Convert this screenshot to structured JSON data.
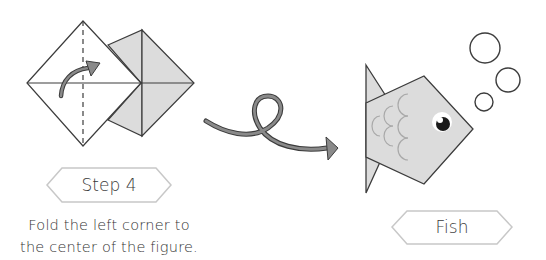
{
  "step": {
    "badge_label": "Step 4",
    "instruction_line1": "Fold the left corner to",
    "instruction_line2": "the center of the figure."
  },
  "result": {
    "badge_label": "Fish"
  },
  "icons": {
    "fold_arrow": "curved-fold-arrow-icon",
    "transition_arrow": "loop-arrow-icon",
    "bubbles": "bubble-icon"
  },
  "colors": {
    "paper_white": "#ffffff",
    "paper_gray": "#d9d9d9",
    "outline": "#3c3c3c",
    "arrow_fill": "#8a8a8a",
    "badge_border": "#c8c8c8",
    "scale_stroke": "#a9a9a9"
  }
}
